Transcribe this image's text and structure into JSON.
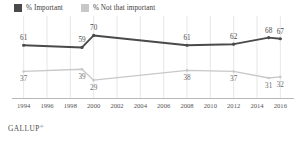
{
  "legend": {
    "items": [
      {
        "label": "% Important",
        "color": "#4a4a4a",
        "icon": "legend-swatch-dark"
      },
      {
        "label": "% Not that important",
        "color": "#c8c8c8",
        "icon": "legend-swatch-light"
      }
    ]
  },
  "footer": {
    "brand": "GALLUP",
    "mark": "®"
  },
  "chart_data": {
    "type": "line",
    "title": "",
    "subtitle": "",
    "xlabel": "",
    "ylabel": "",
    "xlim": [
      1993,
      2017
    ],
    "ylim": [
      20,
      75
    ],
    "grid": "vertical",
    "legend_position": "top-left",
    "x_ticks": [
      "1994",
      "1996",
      "1998",
      "2000",
      "2002",
      "2004",
      "2006",
      "2008",
      "2010",
      "2012",
      "2014",
      "2016"
    ],
    "series": [
      {
        "name": "% Important",
        "color": "#4a4a4a",
        "points": [
          {
            "x": 1994,
            "y": 61,
            "label": "61",
            "marker": true
          },
          {
            "x": 1999,
            "y": 59,
            "label": "59",
            "marker": true
          },
          {
            "x": 2000,
            "y": 70,
            "label": "70",
            "marker": true
          },
          {
            "x": 2008,
            "y": 61,
            "label": "61",
            "marker": true
          },
          {
            "x": 2012,
            "y": 62,
            "label": "62",
            "marker": true
          },
          {
            "x": 2015,
            "y": 68,
            "label": "68",
            "marker": true
          },
          {
            "x": 2016,
            "y": 67,
            "label": "67",
            "marker": true
          }
        ]
      },
      {
        "name": "% Not that important",
        "color": "#c8c8c8",
        "points": [
          {
            "x": 1994,
            "y": 37,
            "label": "37",
            "marker": true
          },
          {
            "x": 1999,
            "y": 39,
            "label": "39",
            "marker": true
          },
          {
            "x": 2000,
            "y": 29,
            "label": "29",
            "marker": true
          },
          {
            "x": 2008,
            "y": 38,
            "label": "38",
            "marker": true
          },
          {
            "x": 2012,
            "y": 37,
            "label": "37",
            "marker": true
          },
          {
            "x": 2015,
            "y": 31,
            "label": "31",
            "marker": true
          },
          {
            "x": 2016,
            "y": 32,
            "label": "32",
            "marker": true
          }
        ]
      }
    ]
  }
}
